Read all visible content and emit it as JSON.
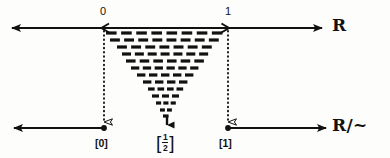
{
  "figure": {
    "background_color": "#fdfdfc",
    "ink_color": "#111111"
  },
  "top_axis": {
    "name": "real-line",
    "label": "R",
    "label_x": 333,
    "label_y": 19,
    "y": 28,
    "x_start": 12,
    "x_end": 322,
    "arrow_left": true,
    "arrow_right": true,
    "ticks": [
      {
        "label": "0",
        "x": 104,
        "label_x": 100,
        "label_y": 7
      },
      {
        "label": "1",
        "x": 228,
        "label_x": 225,
        "label_y": 7
      }
    ]
  },
  "bottom_axis": {
    "name": "quotient-line",
    "label": "R/~",
    "label_x": 333,
    "label_y": 118,
    "y": 128,
    "left_segment": {
      "x_start": 14,
      "x_end": 104,
      "arrow_left": true
    },
    "right_segment": {
      "x_start": 228,
      "x_end": 326,
      "arrow_right": true
    },
    "points": [
      {
        "label": "[0]",
        "x": 104,
        "label_x": 96,
        "label_y": 137
      },
      {
        "label": "[1/2]",
        "x": 167,
        "label_x": 156,
        "label_y": 134,
        "is_fraction": true,
        "numerator": "1",
        "denominator": "2"
      },
      {
        "label": "[1]",
        "x": 228,
        "label_x": 220,
        "label_y": 137
      }
    ]
  },
  "projection_arrows": [
    {
      "name": "projection-arrow-left",
      "x": 104,
      "y_start": 31,
      "y_end": 122,
      "style": "dotted",
      "head": "hollow"
    },
    {
      "name": "projection-arrow-right",
      "x": 228,
      "y_start": 31,
      "y_end": 122,
      "style": "dotted",
      "head": "hollow"
    },
    {
      "name": "collapse-arrow-center",
      "x": 167,
      "y_start": 118,
      "y_end": 126,
      "style": "solid",
      "head": "filled"
    }
  ],
  "collapse_region": {
    "name": "interval-collapse-wedge",
    "description": "Triangular array of dashes showing the unit interval [0,1] collapsing to a single point",
    "apex_x": 167,
    "left_x": 104,
    "right_x": 228,
    "top_y": 33,
    "bottom_y": 121,
    "rows": [
      {
        "y": 33,
        "x_left": 106,
        "x_right": 227,
        "dashes": 8
      },
      {
        "y": 40,
        "x_left": 110,
        "x_right": 223,
        "dashes": 8
      },
      {
        "y": 47,
        "x_left": 117,
        "x_right": 216,
        "dashes": 7
      },
      {
        "y": 54,
        "x_left": 122,
        "x_right": 212,
        "dashes": 7
      },
      {
        "y": 61,
        "x_left": 126,
        "x_right": 208,
        "dashes": 6
      },
      {
        "y": 68,
        "x_left": 131,
        "x_right": 202,
        "dashes": 6
      },
      {
        "y": 75,
        "x_left": 137,
        "x_right": 197,
        "dashes": 5
      },
      {
        "y": 82,
        "x_left": 143,
        "x_right": 191,
        "dashes": 4
      },
      {
        "y": 89,
        "x_left": 148,
        "x_right": 186,
        "dashes": 4
      },
      {
        "y": 96,
        "x_left": 152,
        "x_right": 182,
        "dashes": 3
      },
      {
        "y": 103,
        "x_left": 156,
        "x_right": 178,
        "dashes": 3
      },
      {
        "y": 110,
        "x_left": 160,
        "x_right": 174,
        "dashes": 2
      },
      {
        "y": 116,
        "x_left": 163,
        "x_right": 171,
        "dashes": 1
      }
    ]
  }
}
